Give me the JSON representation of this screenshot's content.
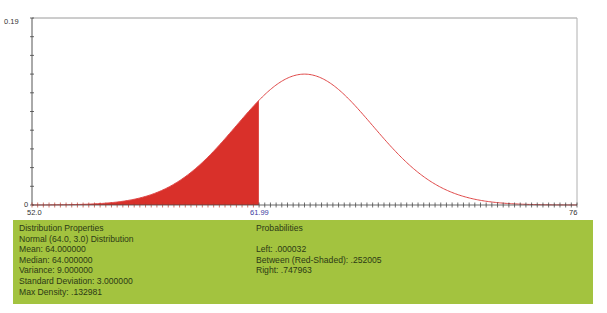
{
  "chart_data": {
    "type": "area",
    "title": "Normal (64.0, 3.0) Distribution",
    "distribution": {
      "name": "Normal",
      "mean": 64.0,
      "sd": 3.0
    },
    "xlabel": "",
    "ylabel": "",
    "xlim": [
      52.0,
      76
    ],
    "ylim": [
      0,
      0.19
    ],
    "x_tick_labels": [
      "52.0",
      "61.99",
      "76"
    ],
    "y_tick_labels": [
      "0",
      "0.19"
    ],
    "shaded_region": {
      "from": 52.0,
      "to": 61.99,
      "color": "#d9302a",
      "label": "Between (Red-Shaded)"
    },
    "curve_color": "#e04848",
    "grid": false,
    "legend": null,
    "x": [
      52,
      54,
      56,
      58,
      60,
      61.99,
      62,
      64,
      66,
      68,
      70,
      72,
      74,
      76
    ],
    "values": [
      4.5e-05,
      0.000514,
      0.003799,
      0.017997,
      0.05467,
      0.106355,
      0.106483,
      0.132981,
      0.106483,
      0.05467,
      0.017997,
      0.003799,
      0.000514,
      4.5e-05
    ]
  },
  "axis": {
    "y_top": "0.19",
    "y_bottom": "0",
    "x_left": "52.0",
    "x_marker": "61.99",
    "x_right": "76"
  },
  "properties": {
    "heading": "Distribution Properties",
    "distribution": "Normal (64.0, 3.0) Distribution",
    "mean": "Mean: 64.000000",
    "median": "Median: 64.000000",
    "variance": "Variance: 9.000000",
    "std_dev": "Standard Deviation: 3.000000",
    "max_density": "Max Density: .132981"
  },
  "probabilities": {
    "heading": "Probabilities",
    "left": "Left: .000032",
    "between": "Between (Red-Shaded): .252005",
    "right": "Right: .747963"
  },
  "colors": {
    "panel": "#a3c33f",
    "shade": "#d9302a",
    "curve": "#e04848",
    "marker_label": "#3a3aa0"
  }
}
